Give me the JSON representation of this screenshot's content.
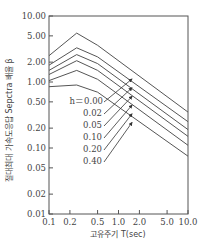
{
  "chart_data": {
    "type": "line",
    "title": "",
    "xlabel": "고유주기 T(sec)",
    "ylabel": "절대최대 가속도응답 Sepctra 배율 β",
    "xscale": "log",
    "yscale": "log",
    "xlim": [
      0.1,
      10.0
    ],
    "ylim": [
      0.01,
      10.0
    ],
    "x_ticks": [
      "0.1",
      "0.2",
      "0.5",
      "1.0",
      "2.0",
      "5.0",
      "10.0"
    ],
    "y_ticks": [
      "10.00",
      "5.00",
      "2.00",
      "1.00",
      "0.50",
      "0.20",
      "0.10",
      "0.05",
      "0.02",
      "0.01"
    ],
    "grid": false,
    "legend_position": "inline annotations with arrows",
    "x": [
      0.1,
      0.25,
      0.5,
      10.0
    ],
    "series": [
      {
        "name": "h=0.00",
        "values": [
          2.5,
          5.5,
          3.6,
          0.35
        ]
      },
      {
        "name": "0.02",
        "values": [
          1.8,
          3.3,
          2.4,
          0.25
        ]
      },
      {
        "name": "0.05",
        "values": [
          1.5,
          2.6,
          1.9,
          0.19
        ]
      },
      {
        "name": "0.10",
        "values": [
          1.3,
          2.1,
          1.5,
          0.15
        ]
      },
      {
        "name": "0.20",
        "values": [
          1.05,
          1.5,
          1.1,
          0.11
        ]
      },
      {
        "name": "0.40",
        "values": [
          0.85,
          0.9,
          0.7,
          0.075
        ]
      }
    ],
    "damping_labels": [
      "h＝0.00",
      "0.02",
      "0.05",
      "0.10",
      "0.20",
      "0.40"
    ]
  }
}
